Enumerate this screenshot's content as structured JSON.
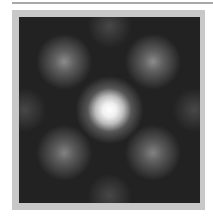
{
  "image": {
    "description": "Grayscale interference/diffraction intensity pattern with bright central spot and four dimmer diagonal spots",
    "colors": {
      "frame": "#c8c8c8",
      "rule": "#a8a8a8",
      "background": "#222222",
      "peak": "#ffffff"
    }
  }
}
